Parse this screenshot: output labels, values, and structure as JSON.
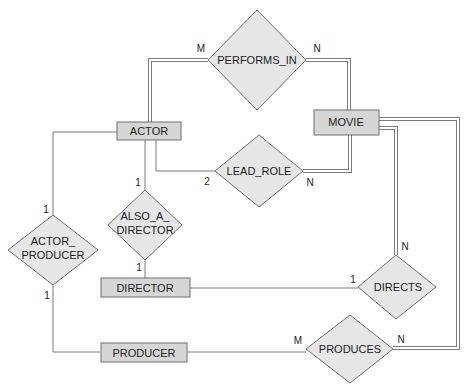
{
  "diagram": {
    "type": "ER diagram",
    "entities": [
      {
        "id": "actor",
        "label": "ACTOR"
      },
      {
        "id": "movie",
        "label": "MOVIE"
      },
      {
        "id": "director",
        "label": "DIRECTOR"
      },
      {
        "id": "producer",
        "label": "PRODUCER"
      }
    ],
    "relationships": [
      {
        "id": "performs_in",
        "label": "PERFORMS_IN"
      },
      {
        "id": "lead_role",
        "label": "LEAD_ROLE"
      },
      {
        "id": "also_a_director",
        "label_line1": "ALSO_A_",
        "label_line2": "DIRECTOR"
      },
      {
        "id": "actor_producer",
        "label_line1": "ACTOR_",
        "label_line2": "PRODUCER"
      },
      {
        "id": "directs",
        "label": "DIRECTS"
      },
      {
        "id": "produces",
        "label": "PRODUCES"
      }
    ],
    "cardinalities": {
      "performs_in_actor": "M",
      "performs_in_movie": "N",
      "lead_role_actor": "2",
      "lead_role_movie": "N",
      "also_a_director_actor": "1",
      "also_a_director_director": "1",
      "actor_producer_actor": "1",
      "actor_producer_producer": "1",
      "directs_director": "1",
      "directs_movie": "N",
      "produces_producer": "M",
      "produces_movie": "N"
    }
  },
  "colors": {
    "entity_fill": "#d6d6d6",
    "relationship_fill": "#e6e6e6",
    "stroke": "#6e6e6e"
  }
}
